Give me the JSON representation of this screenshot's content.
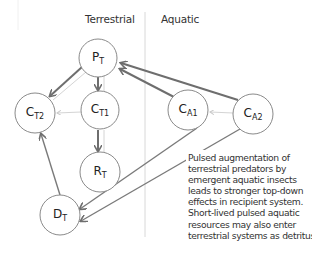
{
  "sections": {
    "terrestrial": "Terrestrial",
    "aquatic": "Aquatic"
  },
  "nodes": {
    "PT": {
      "base": "P",
      "sub": "T"
    },
    "CT1": {
      "base": "C",
      "sub": "T1"
    },
    "CT2": {
      "base": "C",
      "sub": "T2"
    },
    "RT": {
      "base": "R",
      "sub": "T"
    },
    "DT": {
      "base": "D",
      "sub": "T"
    },
    "CA1": {
      "base": "C",
      "sub": "A1"
    },
    "CA2": {
      "base": "C",
      "sub": "A2"
    }
  },
  "caption": {
    "lines": [
      "Pulsed augmentation of",
      "terrestrial predators by",
      "emergent aquatic insects",
      "leads to stronger top-down",
      "effects in recipient system.",
      "Short-lived pulsed aquatic",
      "resources may also enter",
      "terrestrial systems as detritus."
    ]
  },
  "colors": {
    "strong_arrow": "#6e6e6e",
    "weak_link": "#d4d4d4",
    "node_stroke": "#8a8a8a",
    "divider": "#d8d8d8"
  }
}
